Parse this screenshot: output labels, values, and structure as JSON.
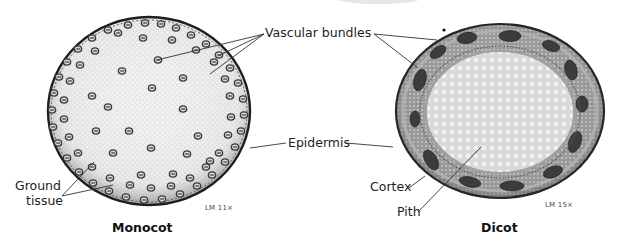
{
  "figure": {
    "panels": [
      {
        "id": "monocot",
        "caption": "Monocot",
        "magnification": "LM 11×",
        "labels": [
          "Vascular bundles",
          "Epidermis",
          "Ground tissue"
        ]
      },
      {
        "id": "dicot",
        "caption": "Dicot",
        "magnification": "LM 15×",
        "labels": [
          "Vascular bundles",
          "Epidermis",
          "Cortex",
          "Pith"
        ]
      }
    ],
    "labels": {
      "vascular_bundles": "Vascular bundles",
      "epidermis": "Epidermis",
      "ground_tissue_line1": "Ground",
      "ground_tissue_line2": "tissue",
      "cortex": "Cortex",
      "pith": "Pith"
    },
    "captions": {
      "monocot": "Monocot",
      "dicot": "Dicot"
    },
    "magnifications": {
      "monocot": "LM 11×",
      "dicot": "LM 15×"
    },
    "colors": {
      "background": "#ffffff",
      "epidermis_dark": "#1e1e1e",
      "tissue_light": "#eeeeee",
      "bundle_dark": "#3a3a3a",
      "cortex_gray": "#8a8a8a",
      "leader_line": "#333333"
    }
  }
}
